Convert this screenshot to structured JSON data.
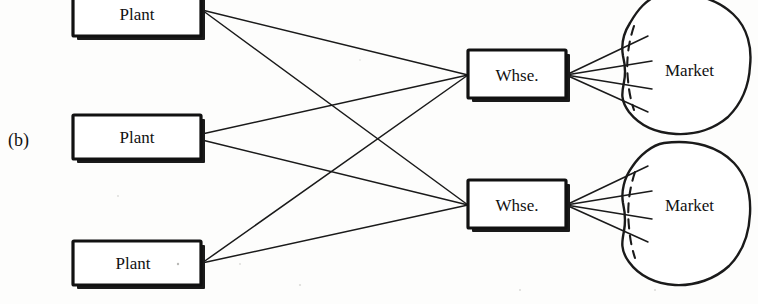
{
  "figure": {
    "panel_label": "(b)",
    "width": 758,
    "height": 304,
    "background_color": "#fdfdfc",
    "ink_color": "#111111"
  },
  "nodes": {
    "plants": [
      {
        "id": "plant-1",
        "label": "Plant",
        "x": 73,
        "y": -8,
        "w": 128,
        "h": 46,
        "anchor_x": 202,
        "anchor_y": 10
      },
      {
        "id": "plant-2",
        "label": "Plant",
        "x": 73,
        "y": 114,
        "w": 128,
        "h": 46,
        "anchor_x": 202,
        "anchor_y": 137
      },
      {
        "id": "plant-3",
        "label": "Plant",
        "x": 73,
        "y": 240,
        "w": 128,
        "h": 46,
        "anchor_x": 202,
        "anchor_y": 263
      }
    ],
    "warehouses": [
      {
        "id": "warehouse-1",
        "label": "Whse.",
        "x": 468,
        "y": 50,
        "w": 98,
        "h": 50,
        "in_x": 468,
        "in_y": 75,
        "out_x": 566,
        "out_y": 75
      },
      {
        "id": "warehouse-2",
        "label": "Whse.",
        "x": 468,
        "y": 180,
        "w": 98,
        "h": 50,
        "in_x": 468,
        "in_y": 205,
        "out_x": 566,
        "out_y": 205
      }
    ],
    "markets": [
      {
        "id": "market-1",
        "label": "Market",
        "cx": 688,
        "cy": 70,
        "label_x": 665,
        "label_y": 76,
        "fan_count": 4
      },
      {
        "id": "market-2",
        "label": "Market",
        "cx": 688,
        "cy": 205,
        "label_x": 665,
        "label_y": 211,
        "fan_count": 4
      }
    ]
  },
  "edges": {
    "description": "Complete bipartite links from every plant to every warehouse",
    "plant_to_warehouse": [
      {
        "from": "plant-1",
        "to": "warehouse-1"
      },
      {
        "from": "plant-1",
        "to": "warehouse-2"
      },
      {
        "from": "plant-2",
        "to": "warehouse-1"
      },
      {
        "from": "plant-2",
        "to": "warehouse-2"
      },
      {
        "from": "plant-3",
        "to": "warehouse-1"
      },
      {
        "from": "plant-3",
        "to": "warehouse-2"
      }
    ],
    "warehouse_to_market": [
      {
        "from": "warehouse-1",
        "to": "market-1",
        "lines": 4
      },
      {
        "from": "warehouse-2",
        "to": "market-2",
        "lines": 4
      }
    ]
  }
}
